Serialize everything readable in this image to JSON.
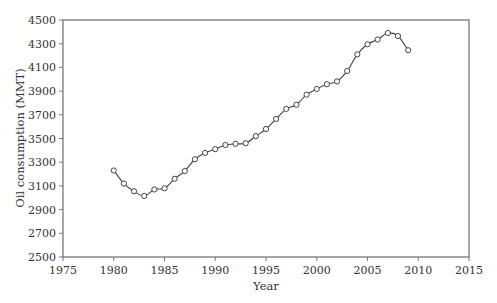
{
  "chart_data": {
    "type": "line",
    "title": "",
    "xlabel": "Year",
    "ylabel": "Oil consumption (MMT)",
    "xlim": [
      1975,
      2015
    ],
    "ylim": [
      2500,
      4500
    ],
    "x_ticks": [
      1975,
      1980,
      1985,
      1990,
      1995,
      2000,
      2005,
      2010,
      2015
    ],
    "y_ticks": [
      2500,
      2700,
      2900,
      3100,
      3300,
      3500,
      3700,
      3900,
      4100,
      4300,
      4500
    ],
    "grid": false,
    "legend": null,
    "markers": "open-circle",
    "line_style": "smooth",
    "series": [
      {
        "name": "Oil consumption",
        "x": [
          1980,
          1981,
          1982,
          1983,
          1984,
          1985,
          1986,
          1987,
          1988,
          1989,
          1990,
          1991,
          1992,
          1993,
          1994,
          1995,
          1996,
          1997,
          1998,
          1999,
          2000,
          2001,
          2002,
          2003,
          2004,
          2005,
          2006,
          2007,
          2008,
          2009
        ],
        "values": [
          3230,
          3120,
          3055,
          3015,
          3070,
          3080,
          3160,
          3225,
          3325,
          3378,
          3410,
          3445,
          3455,
          3460,
          3520,
          3580,
          3665,
          3750,
          3785,
          3870,
          3918,
          3958,
          3982,
          4070,
          4210,
          4295,
          4335,
          4390,
          4365,
          4245
        ]
      }
    ]
  },
  "colors": {
    "axis": "#777777",
    "line": "#444444",
    "marker_fill": "#ffffff",
    "marker_stroke": "#444444",
    "text": "#333333"
  }
}
